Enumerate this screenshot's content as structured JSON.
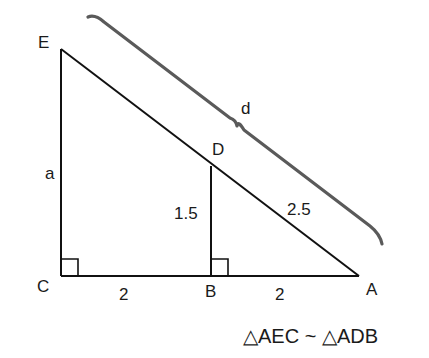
{
  "diagram": {
    "type": "similar-right-triangles",
    "points": {
      "E": {
        "label": "E",
        "x": 61,
        "y": 49
      },
      "C": {
        "label": "C",
        "x": 61,
        "y": 276
      },
      "B": {
        "label": "B",
        "x": 211,
        "y": 276
      },
      "A": {
        "label": "A",
        "x": 359,
        "y": 276
      },
      "D": {
        "label": "D",
        "x": 211,
        "y": 166
      }
    },
    "segments": [
      {
        "from": "E",
        "to": "C",
        "label": "a"
      },
      {
        "from": "C",
        "to": "B",
        "label": "2"
      },
      {
        "from": "B",
        "to": "A",
        "label": "2"
      },
      {
        "from": "E",
        "to": "A",
        "label": ""
      },
      {
        "from": "D",
        "to": "B",
        "label": "1.5"
      },
      {
        "from": "D",
        "to": "A",
        "label": "2.5"
      }
    ],
    "right_angles": [
      "C",
      "B"
    ],
    "brace": {
      "from": "E",
      "to": "D",
      "label": "d"
    },
    "labels": {
      "E": "E",
      "C": "C",
      "B": "B",
      "A": "A",
      "D": "D",
      "side_a": "a",
      "side_CB": "2",
      "side_BA": "2",
      "side_DB": "1.5",
      "side_DA": "2.5",
      "brace_d": "d"
    },
    "caption": "△AEC ~ △ADB",
    "colors": {
      "line": "#111111",
      "brace": "#555555",
      "text": "#1a1a1a",
      "background": "#ffffff"
    }
  }
}
